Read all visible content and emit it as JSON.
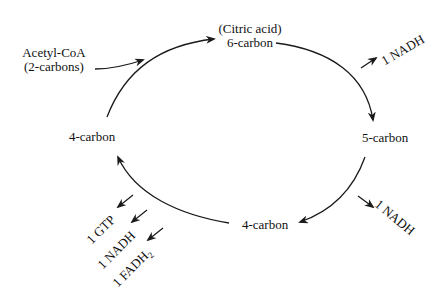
{
  "diagram": {
    "nodes": {
      "citric_acid_note": "(Citric acid)",
      "six_carbon": "6-carbon",
      "five_carbon": "5-carbon",
      "four_carbon_bottom": "4-carbon",
      "four_carbon_left": "4-carbon",
      "acetyl_coa_line1": "Acetyl-CoA",
      "acetyl_coa_line2": "(2-carbons)"
    },
    "outputs": {
      "nadh_top_right": "1 NADH",
      "nadh_bottom_right": "1 NADH",
      "gtp": "1 GTP",
      "nadh_bottom_left": "1 NADH",
      "fadh2_prefix": "1 FADH",
      "fadh2_sub": "2"
    },
    "colors": {
      "stroke": "#1a1a1a",
      "text": "#111111",
      "background": "#ffffff"
    }
  }
}
